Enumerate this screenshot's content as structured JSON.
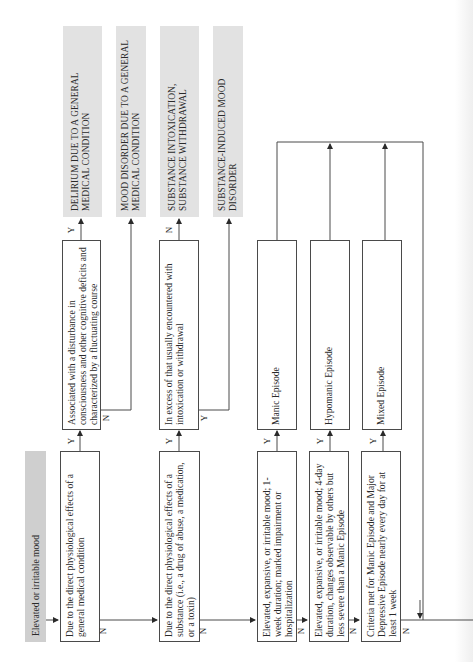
{
  "diagram": {
    "title": "Elevated or irritable mood",
    "orientation": "rotated-90-ccw",
    "decisions": [
      {
        "id": "d1",
        "text": "Due to the direct physiological effects of a general medical condition"
      },
      {
        "id": "d2",
        "text": "Associated with a disturbance in consciousness and other cognitive deficits and characterized by a fluctuating course"
      },
      {
        "id": "d3",
        "text": "Due to the direct physiological effects of a substance (i.e., a drug of abuse, a medication, or a toxin)"
      },
      {
        "id": "d4",
        "text": "In excess of that usually encountered with intoxication or withdrawal"
      },
      {
        "id": "d5",
        "text": "Elevated, expansive, or irritable mood; 1-week duration; marked impairment or hospitalization"
      },
      {
        "id": "d6",
        "text": "Elevated, expansive, or irritable mood; 4-day duration, changes observable by others but less severe than a Manic Episode"
      },
      {
        "id": "d7",
        "text": "Criteria met for Manic Episode and Major Depressive Episode nearly every day for at least 1 week"
      }
    ],
    "episodes": [
      {
        "id": "e1",
        "text": "Manic Episode"
      },
      {
        "id": "e2",
        "text": "Hypomanic Episode"
      },
      {
        "id": "e3",
        "text": "Mixed Episode"
      }
    ],
    "outcomes": [
      {
        "id": "o1",
        "text": "DELIRIUM DUE TO A GENERAL MEDICAL CONDITION"
      },
      {
        "id": "o2",
        "text": "MOOD DISORDER DUE TO A GENERAL MEDICAL CONDITION"
      },
      {
        "id": "o3",
        "text": "SUBSTANCE INTOXICATION, SUBSTANCE WITHDRAWAL"
      },
      {
        "id": "o4",
        "text": "SUBSTANCE-INDUCED MOOD DISORDER"
      }
    ],
    "edge_labels": {
      "yes": "Y",
      "no": "N"
    },
    "colors": {
      "outcome_fill": "#e2e2e2",
      "start_fill": "#cfcfcf",
      "line": "#4a4a4a"
    }
  }
}
